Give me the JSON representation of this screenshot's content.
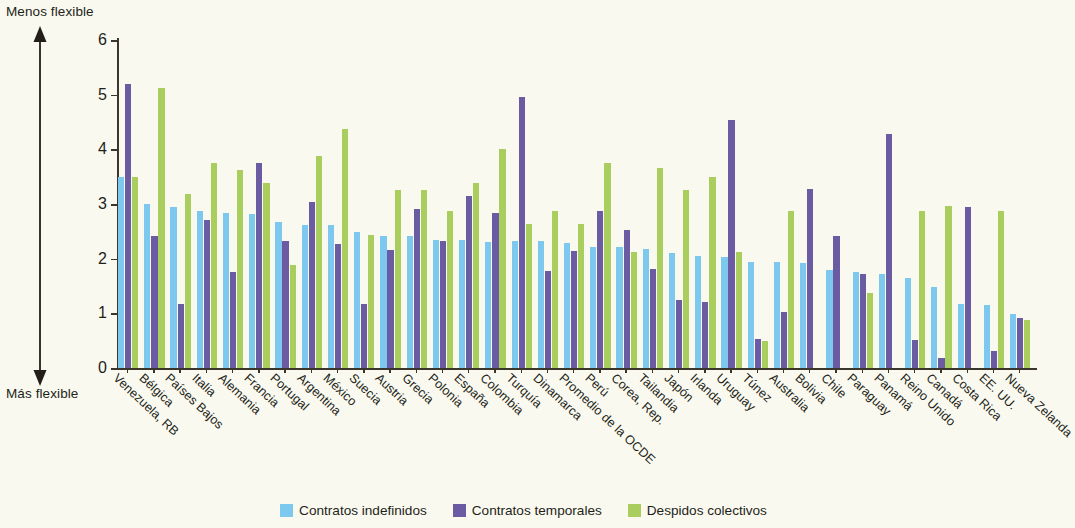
{
  "annotations": {
    "top_label": "Menos flexible",
    "bottom_label": "Más flexible"
  },
  "legend": {
    "items": [
      {
        "label": "Contratos indefinidos",
        "color": "#7CC8EE"
      },
      {
        "label": "Contratos temporales",
        "color": "#6A5BA3"
      },
      {
        "label": "Despidos colectivos",
        "color": "#A9CE5E"
      }
    ]
  },
  "chart_data": {
    "type": "bar",
    "title": "",
    "subtitle": "",
    "xlabel": "",
    "ylabel": "",
    "ylim": [
      0,
      6
    ],
    "yticks": [
      0,
      1,
      2,
      3,
      4,
      5,
      6
    ],
    "grid": false,
    "legend_position": "bottom",
    "orientation": "vertical",
    "axis_direction_notes": {
      "top": "Menos flexible",
      "bottom": "Más flexible"
    },
    "categories": [
      "Venezuela, RB",
      "Bélgica",
      "Países Bajos",
      "Italia",
      "Alemania",
      "Francia",
      "Portugal",
      "Argentina",
      "México",
      "Suecia",
      "Austria",
      "Grecia",
      "Polonia",
      "España",
      "Colombia",
      "Turquía",
      "Dinamarca",
      "Promedio de la OCDE",
      "Perú",
      "Corea, Rep.",
      "Tailandia",
      "Japón",
      "Irlanda",
      "Uruguay",
      "Túnez",
      "Australia",
      "Bolivia",
      "Chile",
      "Paraguay",
      "Panamá",
      "Reino Unido",
      "Canadá",
      "Costa Rica",
      "EE. UU.",
      "Nueva Zelanda"
    ],
    "series": [
      {
        "name": "Contratos indefinidos",
        "color": "#7CC8EE",
        "values": [
          3.5,
          3.0,
          2.95,
          2.88,
          2.84,
          2.81,
          2.68,
          2.61,
          2.61,
          2.48,
          2.42,
          2.41,
          2.35,
          2.34,
          2.31,
          2.33,
          2.33,
          2.28,
          2.21,
          2.21,
          2.17,
          2.1,
          2.05,
          2.03,
          1.94,
          1.94,
          1.92,
          1.8,
          1.75,
          1.72,
          1.65,
          1.48,
          1.18,
          1.15,
          0.98
        ]
      },
      {
        "name": "Contratos temporales",
        "color": "#6A5BA3",
        "values": [
          5.2,
          2.41,
          1.17,
          2.7,
          1.76,
          3.75,
          2.33,
          3.04,
          2.27,
          1.17,
          2.16,
          2.9,
          2.33,
          3.15,
          2.83,
          4.96,
          1.78,
          2.14,
          2.87,
          2.53,
          1.82,
          1.25,
          1.21,
          4.54,
          0.53,
          1.03,
          3.28,
          2.41,
          1.72,
          4.28,
          0.51,
          0.19,
          2.94,
          0.31,
          0.92
        ]
      },
      {
        "name": "Despidos colectivos",
        "color": "#A9CE5E",
        "values": [
          3.5,
          5.13,
          3.19,
          3.75,
          3.63,
          3.38,
          1.88,
          3.88,
          4.38,
          2.44,
          3.25,
          3.25,
          2.88,
          3.38,
          4.0,
          2.63,
          2.88,
          2.63,
          3.75,
          2.13,
          3.66,
          3.25,
          3.5,
          2.13,
          0.5,
          2.88,
          0.0,
          0.0,
          1.38,
          0.0,
          2.88,
          2.97,
          0.0,
          2.88,
          0.88
        ]
      }
    ]
  }
}
